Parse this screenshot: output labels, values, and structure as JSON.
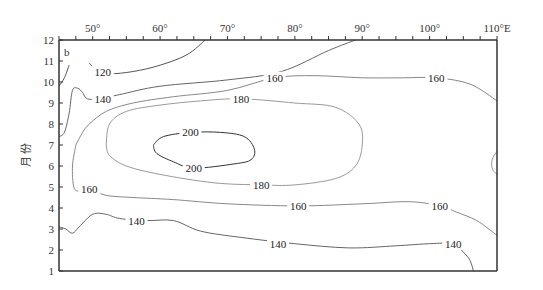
{
  "chart_data": {
    "type": "contour",
    "panel_label": "b",
    "title": "",
    "xlabel": "",
    "ylabel": "月 份",
    "x_unit": "°E",
    "xlim": [
      45,
      110
    ],
    "ylim": [
      1,
      12
    ],
    "x_ticks": [
      {
        "value": 50,
        "label": "50°"
      },
      {
        "value": 60,
        "label": "60°"
      },
      {
        "value": 70,
        "label": "70°"
      },
      {
        "value": 80,
        "label": "80°"
      },
      {
        "value": 90,
        "label": "90°"
      },
      {
        "value": 100,
        "label": "100°"
      },
      {
        "value": 110,
        "label": "110°E"
      }
    ],
    "y_ticks": [
      1,
      2,
      3,
      4,
      5,
      6,
      7,
      8,
      9,
      10,
      11,
      12
    ],
    "x_minor_step": 2.5,
    "contour_levels": [
      120,
      140,
      160,
      180,
      200
    ],
    "contours": [
      {
        "level": 120,
        "color": "#555555",
        "label_positions": [
          [
            51.5,
            10.5
          ]
        ],
        "points": [
          [
            49.5,
            10.9
          ],
          [
            50.5,
            10.6
          ],
          [
            52.5,
            10.4
          ],
          [
            56,
            10.5
          ],
          [
            60,
            10.8
          ],
          [
            64,
            11.3
          ],
          [
            66.7,
            12.0
          ]
        ]
      },
      {
        "level": 120,
        "color": "#555555",
        "label_positions": [],
        "points": [
          [
            45,
            9.8
          ],
          [
            45.8,
            10.2
          ],
          [
            46.5,
            10.8
          ]
        ]
      },
      {
        "level": 140,
        "color": "#666666",
        "label_positions": [
          [
            51.5,
            9.2
          ],
          [
            56.5,
            3.4
          ],
          [
            77.5,
            2.3
          ],
          [
            103.5,
            2.3
          ]
        ],
        "points": [
          [
            45,
            7.4
          ],
          [
            45.8,
            7.6
          ],
          [
            46.5,
            8.5
          ],
          [
            47,
            9.6
          ],
          [
            47.8,
            9.7
          ],
          [
            48.5,
            9.5
          ],
          [
            49.2,
            9.2
          ],
          [
            51,
            9.2
          ],
          [
            54,
            9.4
          ],
          [
            60,
            9.8
          ],
          [
            70,
            10.1
          ],
          [
            78,
            10.5
          ],
          [
            85,
            11.5
          ],
          [
            89,
            12.0
          ]
        ]
      },
      {
        "level": 140,
        "color": "#666666",
        "label_positions": [],
        "points": [
          [
            45,
            3.1
          ],
          [
            46,
            3.0
          ],
          [
            47,
            2.8
          ],
          [
            48,
            3.1
          ],
          [
            50,
            3.7
          ],
          [
            52,
            3.7
          ],
          [
            54,
            3.5
          ],
          [
            58,
            3.4
          ],
          [
            62,
            3.4
          ],
          [
            66,
            2.9
          ],
          [
            72,
            2.6
          ],
          [
            80,
            2.3
          ],
          [
            88,
            2.1
          ],
          [
            95,
            2.2
          ],
          [
            100,
            2.3
          ],
          [
            103.5,
            2.3
          ],
          [
            105,
            1.9
          ],
          [
            106,
            1.5
          ],
          [
            106.5,
            1.0
          ]
        ]
      },
      {
        "level": 160,
        "color": "#888888",
        "label_positions": [
          [
            49.5,
            4.9
          ],
          [
            77,
            10.2
          ],
          [
            101,
            10.2
          ],
          [
            80.5,
            4.1
          ],
          [
            101.5,
            4.1
          ]
        ],
        "points": [
          [
            47.5,
            7.0
          ],
          [
            47,
            6.0
          ],
          [
            47.2,
            5.0
          ],
          [
            48,
            4.8
          ],
          [
            49.5,
            4.9
          ],
          [
            52,
            4.6
          ],
          [
            56,
            4.5
          ],
          [
            62,
            4.4
          ],
          [
            70,
            4.2
          ],
          [
            80.5,
            4.1
          ],
          [
            90,
            4.2
          ],
          [
            97,
            4.3
          ],
          [
            101.5,
            4.1
          ],
          [
            104,
            3.8
          ],
          [
            107,
            3.4
          ],
          [
            110,
            2.7
          ]
        ]
      },
      {
        "level": 160,
        "color": "#888888",
        "label_positions": [],
        "points": [
          [
            47.5,
            7.0
          ],
          [
            48.5,
            7.6
          ],
          [
            49.5,
            8.0
          ],
          [
            52,
            8.6
          ],
          [
            56,
            9.0
          ],
          [
            62,
            9.3
          ],
          [
            70,
            9.6
          ],
          [
            77,
            10.2
          ],
          [
            83,
            10.3
          ],
          [
            90,
            10.2
          ],
          [
            96,
            10.2
          ],
          [
            101,
            10.2
          ],
          [
            106,
            9.9
          ],
          [
            110,
            9.1
          ]
        ]
      },
      {
        "level": 180,
        "color": "#999999",
        "label_positions": [
          [
            72,
            9.2
          ],
          [
            75,
            5.1
          ]
        ],
        "points": [
          [
            52,
            7.0
          ],
          [
            52.5,
            8.0
          ],
          [
            55,
            8.6
          ],
          [
            60,
            8.9
          ],
          [
            66,
            9.1
          ],
          [
            72,
            9.2
          ],
          [
            80,
            9.0
          ],
          [
            86,
            8.8
          ],
          [
            89.5,
            8.0
          ],
          [
            90,
            7.0
          ],
          [
            89,
            6.0
          ],
          [
            86,
            5.4
          ],
          [
            80,
            5.1
          ],
          [
            75,
            5.1
          ],
          [
            68,
            5.2
          ],
          [
            60,
            5.6
          ],
          [
            55,
            6.0
          ],
          [
            52.5,
            6.5
          ],
          [
            52,
            7.0
          ]
        ]
      },
      {
        "level": 200,
        "color": "#333333",
        "label_positions": [
          [
            64.5,
            7.6
          ],
          [
            65,
            5.9
          ]
        ],
        "points": [
          [
            59,
            7.0
          ],
          [
            60.5,
            7.4
          ],
          [
            64.5,
            7.6
          ],
          [
            69,
            7.6
          ],
          [
            72.5,
            7.4
          ],
          [
            74,
            6.8
          ],
          [
            73.5,
            6.3
          ],
          [
            71,
            6.1
          ],
          [
            65,
            5.9
          ],
          [
            62,
            6.2
          ],
          [
            59.5,
            6.6
          ],
          [
            59,
            7.0
          ]
        ]
      },
      {
        "level": 180,
        "color": "#999999",
        "label_positions": [],
        "points": [
          [
            110,
            6.7
          ],
          [
            109.4,
            6.4
          ],
          [
            109.2,
            6.1
          ],
          [
            109.4,
            5.8
          ],
          [
            110,
            5.6
          ]
        ]
      }
    ]
  }
}
